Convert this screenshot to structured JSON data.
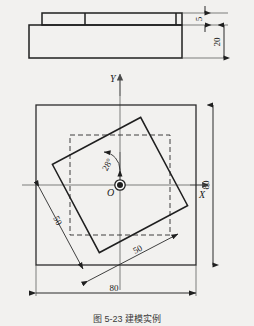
{
  "figure": {
    "caption": "图 5-23  建模实例",
    "background_color": "#f2f1ef",
    "line_color": "#2b2b2b"
  },
  "front_view": {
    "name": "front-elevation",
    "dimensions": [
      {
        "label": "5",
        "orientation": "vertical",
        "describes": "top-plate-thickness"
      },
      {
        "label": "20",
        "orientation": "vertical",
        "describes": "base-block-height"
      }
    ]
  },
  "top_view": {
    "name": "plan-view",
    "origin_label": "O",
    "axis_x_label": "X",
    "axis_y_label": "Y",
    "outer_square": {
      "size": "80",
      "style": "solid"
    },
    "inner_square": {
      "size": "50",
      "style": "dashed"
    },
    "rotated_square": {
      "size": "50",
      "rotation": "28°",
      "style": "solid"
    },
    "dimensions": [
      {
        "label": "80",
        "orientation": "vertical",
        "position": "right"
      },
      {
        "label": "80",
        "orientation": "horizontal",
        "position": "bottom"
      },
      {
        "label": "50",
        "orientation": "diagonal",
        "position": "left"
      },
      {
        "label": "50",
        "orientation": "diagonal",
        "position": "bottom-right"
      },
      {
        "label": "28°",
        "orientation": "angular",
        "position": "center-upper"
      }
    ]
  }
}
